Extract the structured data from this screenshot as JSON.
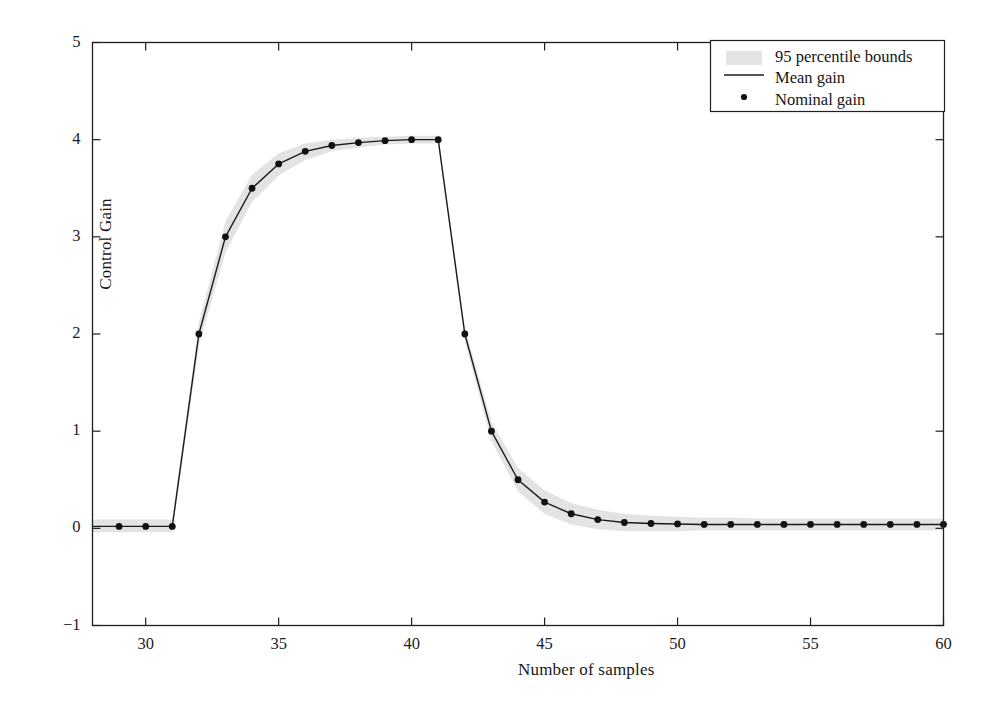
{
  "chart_data": {
    "type": "line",
    "title": "",
    "xlabel": "Number of samples",
    "ylabel": "Control Gain",
    "xlim": [
      28,
      60
    ],
    "ylim": [
      -1,
      5
    ],
    "xticks": [
      30,
      35,
      40,
      45,
      50,
      55,
      60
    ],
    "yticks": [
      -1,
      0,
      1,
      2,
      3,
      4,
      5
    ],
    "grid": false,
    "legend_position": "upper right",
    "legend": [
      {
        "label": "95 percentile bounds",
        "marker": "band",
        "color": "#e2e2e2"
      },
      {
        "label": "Mean gain",
        "marker": "line",
        "color": "#1a1a1a"
      },
      {
        "label": "Nominal gain",
        "marker": "dot",
        "color": "#111111"
      }
    ],
    "x": [
      28,
      29,
      30,
      31,
      32,
      33,
      34,
      35,
      36,
      37,
      38,
      39,
      40,
      41,
      42,
      43,
      44,
      45,
      46,
      47,
      48,
      49,
      50,
      51,
      52,
      53,
      54,
      55,
      56,
      57,
      58,
      59,
      60
    ],
    "series": [
      {
        "name": "Mean gain",
        "values": [
          0.02,
          0.02,
          0.02,
          0.02,
          2.0,
          3.0,
          3.5,
          3.75,
          3.88,
          3.94,
          3.97,
          3.99,
          4.0,
          4.0,
          2.0,
          1.0,
          0.5,
          0.27,
          0.15,
          0.09,
          0.06,
          0.05,
          0.045,
          0.04,
          0.04,
          0.04,
          0.04,
          0.04,
          0.04,
          0.04,
          0.04,
          0.04,
          0.04
        ]
      },
      {
        "name": "Nominal gain",
        "marker_only": true,
        "marker_x": [
          29,
          30,
          31,
          32,
          33,
          34,
          35,
          36,
          37,
          38,
          39,
          40,
          41,
          42,
          43,
          44,
          45,
          46,
          47,
          48,
          49,
          50,
          51,
          52,
          53,
          54,
          55,
          56,
          57,
          58,
          59,
          60
        ],
        "marker_y": [
          0.02,
          0.02,
          0.02,
          2.0,
          3.0,
          3.5,
          3.75,
          3.88,
          3.94,
          3.97,
          3.99,
          4.0,
          4.0,
          2.0,
          1.0,
          0.5,
          0.27,
          0.15,
          0.09,
          0.06,
          0.05,
          0.045,
          0.04,
          0.04,
          0.04,
          0.04,
          0.04,
          0.04,
          0.04,
          0.04,
          0.04,
          0.04
        ]
      }
    ],
    "band_upper": [
      0.09,
      0.09,
      0.09,
      0.09,
      2.12,
      3.16,
      3.64,
      3.86,
      3.96,
      4.0,
      4.02,
      4.03,
      4.04,
      4.04,
      2.07,
      1.1,
      0.62,
      0.39,
      0.26,
      0.19,
      0.15,
      0.13,
      0.12,
      0.11,
      0.11,
      0.1,
      0.1,
      0.1,
      0.1,
      0.1,
      0.1,
      0.1,
      0.1
    ],
    "band_lower": [
      -0.04,
      -0.04,
      -0.04,
      -0.04,
      1.88,
      2.84,
      3.36,
      3.63,
      3.79,
      3.88,
      3.92,
      3.95,
      3.96,
      3.96,
      1.93,
      0.9,
      0.38,
      0.15,
      0.04,
      -0.01,
      -0.03,
      -0.03,
      -0.03,
      -0.02,
      -0.02,
      -0.02,
      -0.02,
      -0.02,
      -0.02,
      -0.02,
      -0.02,
      -0.02,
      -0.02
    ]
  },
  "xtick_labels": [
    "30",
    "35",
    "40",
    "45",
    "50",
    "55",
    "60"
  ],
  "ytick_labels": [
    "5",
    "4",
    "3",
    "2",
    "1",
    "0",
    "−1"
  ],
  "axes": {
    "xlabel": "Number of samples",
    "ylabel": "Control Gain"
  },
  "legend": {
    "items": [
      {
        "label": "95 percentile bounds"
      },
      {
        "label": "Mean gain"
      },
      {
        "label": "Nominal gain"
      }
    ]
  }
}
